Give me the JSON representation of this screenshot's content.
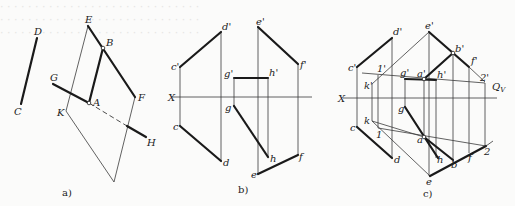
{
  "figure": {
    "background_bleed_lines": [
      "· · · · · · · · · · · · · · · · · · · · · · · · · · · · ·",
      "· · · · · · · · · · · · · · · · · · · · · · · · · · · · ·",
      "· · · · · · · · · · · · · · · · · · · · · · · · · · · · ·"
    ],
    "panels": [
      {
        "id": "a",
        "caption": "a)",
        "labels": {
          "D": "D",
          "C": "C",
          "E": "E",
          "B": "B",
          "G": "G",
          "A": "A",
          "F": "F",
          "K": "K",
          "H": "H"
        }
      },
      {
        "id": "b",
        "caption": "b)",
        "axis_label": "X",
        "labels": {
          "d_p": "d'",
          "c_p": "c'",
          "c": "c",
          "d": "d",
          "e_p": "e'",
          "f_p": "f'",
          "g_p": "g'",
          "h_p": "h'",
          "g": "g",
          "h": "h",
          "e": "e",
          "f": "f"
        }
      },
      {
        "id": "c",
        "caption": "c)",
        "axis_label": "X",
        "plane_label": "Q",
        "plane_subscript": "V",
        "labels": {
          "d_p": "d'",
          "e_p": "e'",
          "b_p": "b'",
          "f_p": "f'",
          "c_p": "c'",
          "one_p": "1'",
          "k_p": "k'",
          "g_p": "g'",
          "a_p": "a'",
          "h_p": "h'",
          "two_p": "2'",
          "g": "g",
          "k": "k",
          "c": "c",
          "one": "1",
          "a": "a",
          "d": "d",
          "h": "h",
          "e": "e",
          "b": "b",
          "f": "f",
          "two": "2"
        }
      }
    ]
  }
}
